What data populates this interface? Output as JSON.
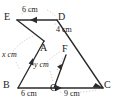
{
  "figure": {
    "type": "geometry-diagram",
    "stroke_color": "#2b2b2b",
    "guide_color": "#b9b9b9",
    "background": "#ffffff",
    "vertices": [
      {
        "id": "E",
        "label": "E",
        "x": 17,
        "y": 20,
        "label_x": 4,
        "label_y": 13
      },
      {
        "id": "D",
        "label": "D",
        "x": 57,
        "y": 20,
        "label_x": 59,
        "label_y": 13
      },
      {
        "id": "A",
        "label": "A",
        "x": 44,
        "y": 41,
        "label_x": 41,
        "label_y": 44
      },
      {
        "id": "F",
        "label": "F",
        "x": 66,
        "y": 55,
        "label_x": 63,
        "label_y": 46
      },
      {
        "id": "B",
        "label": "B",
        "x": 18,
        "y": 88,
        "label_x": 3,
        "label_y": 81
      },
      {
        "id": "G",
        "label": "G",
        "x": 54,
        "y": 88,
        "label_x": 51,
        "label_y": 82
      },
      {
        "id": "C",
        "label": "C",
        "x": 103,
        "y": 88,
        "label_x": 105,
        "label_y": 81
      }
    ],
    "segments": [
      {
        "id": "ED",
        "from": "E",
        "to": "D",
        "arrow": "mid-toward-E"
      },
      {
        "id": "EA",
        "from": "E",
        "to": "A",
        "arrow": "none"
      },
      {
        "id": "DC",
        "from": "D",
        "to": "C",
        "arrow": "end",
        "through": [
          "A",
          "F"
        ]
      },
      {
        "id": "BA",
        "from": "B",
        "to": "A",
        "arrow": "mid-toward-A"
      },
      {
        "id": "GF",
        "from": "G",
        "to": "F",
        "arrow": "mid-toward-F"
      },
      {
        "id": "BC",
        "from": "B",
        "to": "C",
        "arrow": "mid-toward-C"
      }
    ],
    "measures": [
      {
        "id": "ED-len",
        "text": "6 cm",
        "x": 24,
        "y": 10,
        "italic": false
      },
      {
        "id": "DA-len",
        "text": "4 cm",
        "x": 56,
        "y": 30,
        "italic": false
      },
      {
        "id": "BA-len",
        "text": "x cm",
        "x": 3,
        "y": 55,
        "italic": true
      },
      {
        "id": "GF-len",
        "text": "y cm",
        "x": 35,
        "y": 65,
        "italic": true
      },
      {
        "id": "BG-len",
        "text": "6 cm",
        "x": 25,
        "y": 94,
        "italic": false
      },
      {
        "id": "GC-len",
        "text": "9 cm",
        "x": 65,
        "y": 94,
        "italic": false
      }
    ]
  }
}
